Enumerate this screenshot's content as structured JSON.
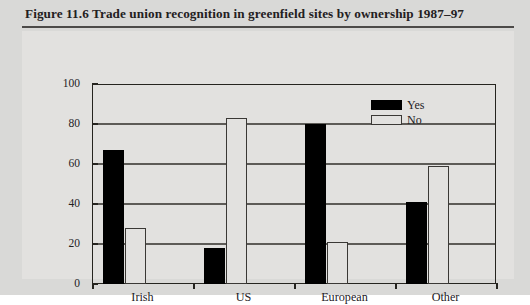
{
  "figure": {
    "title": "Figure 11.6 Trade union recognition in greenfield sites by ownership 1987–97"
  },
  "chart_data": {
    "type": "bar",
    "title": "Figure 11.6 Trade union recognition in greenfield sites by ownership 1987–97",
    "categories": [
      "Irish",
      "US",
      "European",
      "Other"
    ],
    "series": [
      {
        "name": "Yes",
        "values": [
          67,
          18,
          80,
          41
        ],
        "color": "#000000"
      },
      {
        "name": "No",
        "values": [
          28,
          83,
          21,
          59
        ],
        "color": "#ffffff"
      }
    ],
    "xlabel": "",
    "ylabel": "",
    "ylim": [
      0,
      100
    ],
    "yticks": [
      0,
      20,
      40,
      60,
      80,
      100
    ],
    "ytick_labels": [
      "0",
      "20",
      "40",
      "60",
      "80",
      "100"
    ],
    "grid": true,
    "legend_position": "top-right"
  },
  "colors": {
    "page_background": "#d9d9d7",
    "panel_background": "#e2e1df",
    "axis": "#25241f",
    "gridline": "#5d5b57",
    "text": "#24211f"
  }
}
